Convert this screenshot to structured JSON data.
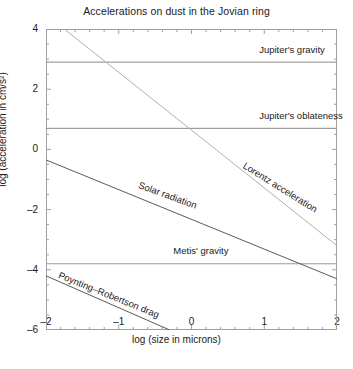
{
  "chart_data": {
    "type": "line",
    "title": "Accelerations on dust in the Jovian ring",
    "xlabel": "log (size in microns)",
    "ylabel": "log (acceleration in cm/s²)",
    "xlim": [
      -2,
      2
    ],
    "ylim": [
      -6,
      4
    ],
    "xticks": [
      -2,
      -1,
      0,
      1,
      2
    ],
    "xtick_labels": [
      "–2",
      "–1",
      "0",
      "1",
      "2"
    ],
    "yticks": [
      -6,
      -4,
      -2,
      0,
      2,
      4
    ],
    "ytick_labels": [
      "–6",
      "–4",
      "–2",
      "0",
      "2",
      "4"
    ],
    "xminor_interval": 0.2,
    "yminor_interval": 0.5,
    "grid": false,
    "legend": "inline-annotations",
    "series": [
      {
        "name": "Jupiter's gravity",
        "label": "Jupiter's gravity",
        "style": "horizontal",
        "color": "#8a8a8a",
        "points": [
          [
            -2,
            2.9
          ],
          [
            2,
            2.9
          ]
        ],
        "label_x": 0.93,
        "label_y": 3.28
      },
      {
        "name": "Jupiter's oblateness",
        "label": "Jupiter's oblateness",
        "style": "horizontal",
        "color": "#8a8a8a",
        "points": [
          [
            -2,
            0.7
          ],
          [
            2,
            0.7
          ]
        ],
        "label_x": 0.93,
        "label_y": 1.08
      },
      {
        "name": "Metis' gravity",
        "label": "Metis' gravity",
        "style": "horizontal",
        "color": "#9a9a9a",
        "points": [
          [
            -2,
            -3.8
          ],
          [
            2,
            -3.8
          ]
        ],
        "label_x": -0.25,
        "label_y": -3.42
      },
      {
        "name": "Lorentz acceleration",
        "label": "Lorentz acceleration",
        "style": "sloped",
        "color": "#b0b0b0",
        "points": [
          [
            -1.75,
            4.0
          ],
          [
            2,
            -3.2
          ]
        ],
        "label_x": 0.72,
        "label_y": -0.55,
        "label_rotation": 32
      },
      {
        "name": "Solar radiation",
        "label": "Solar radiation",
        "style": "sloped",
        "color": "#595959",
        "points": [
          [
            -2,
            -0.35
          ],
          [
            2,
            -4.3
          ]
        ],
        "label_x": -0.72,
        "label_y": -1.2,
        "label_rotation": 20
      },
      {
        "name": "Poynting-Robertson drag",
        "label": "Poynting–Robertson drag",
        "style": "sloped",
        "color": "#595959",
        "points": [
          [
            -2,
            -4.2
          ],
          [
            -0.3,
            -6.0
          ]
        ],
        "label_x": -1.82,
        "label_y": -4.22,
        "label_rotation": 22
      }
    ]
  },
  "axes": {
    "frame_color": "#a0a0a0",
    "tick_color": "#a0a0a0"
  }
}
